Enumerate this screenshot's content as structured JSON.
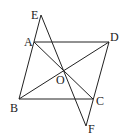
{
  "diagram": {
    "type": "geometry",
    "points": {
      "A": {
        "label": "A",
        "x": 34,
        "y": 42,
        "lx": 24,
        "ly": 46
      },
      "B": {
        "label": "B",
        "x": 19,
        "y": 99,
        "lx": 10,
        "ly": 112
      },
      "C": {
        "label": "C",
        "x": 93,
        "y": 99,
        "lx": 96,
        "ly": 105
      },
      "D": {
        "label": "D",
        "x": 109,
        "y": 42,
        "lx": 110,
        "ly": 41
      },
      "E": {
        "label": "E",
        "x": 41,
        "y": 15,
        "lx": 31,
        "ly": 19
      },
      "F": {
        "label": "F",
        "x": 86,
        "y": 126,
        "lx": 88,
        "ly": 133
      },
      "O": {
        "label": "O",
        "x": 63,
        "y": 70,
        "lx": 56,
        "ly": 84
      }
    },
    "segments": [
      [
        "E",
        "B"
      ],
      [
        "A",
        "D"
      ],
      [
        "B",
        "C"
      ],
      [
        "D",
        "F"
      ],
      [
        "A",
        "C"
      ],
      [
        "B",
        "D"
      ],
      [
        "E",
        "F"
      ]
    ],
    "stroke_color": "#222222"
  }
}
